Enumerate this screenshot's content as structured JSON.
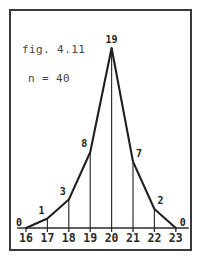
{
  "figure": {
    "caption": "fig. 4.11",
    "sample_size_label": "n = 40"
  },
  "chart_data": {
    "type": "line",
    "title": "fig. 4.11",
    "subtitle": "n = 40",
    "xlabel": "",
    "ylabel": "",
    "categories": [
      "16",
      "17",
      "18",
      "19",
      "20",
      "21",
      "22",
      "23"
    ],
    "values": [
      0,
      1,
      3,
      8,
      19,
      7,
      2,
      0
    ],
    "value_labels": [
      "0",
      "1",
      "3",
      "8",
      "19",
      "7",
      "2",
      "0"
    ],
    "xlim": [
      16,
      23
    ],
    "ylim": [
      0,
      19
    ],
    "grid": false,
    "legend": null,
    "annotations": [
      "fig. 4.11",
      "n = 40"
    ],
    "line_color": "#1f1f1f",
    "axis_color": "#2b2b2b",
    "background_color": "#ffffff",
    "border_color": "#3a3a3a"
  },
  "axis": {
    "tick_labels": [
      "16",
      "17",
      "18",
      "19",
      "20",
      "21",
      "22",
      "23"
    ]
  }
}
